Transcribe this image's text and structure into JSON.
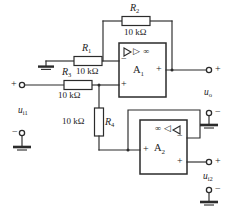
{
  "diagram": {
    "type": "schematic"
  },
  "components": {
    "r1": {
      "ref": "R",
      "sub": "1",
      "value": "10 kΩ"
    },
    "r2": {
      "ref": "R",
      "sub": "2",
      "value": "10 kΩ"
    },
    "r3": {
      "ref": "R",
      "sub": "3",
      "value": "10 kΩ"
    },
    "r4": {
      "ref": "R",
      "sub": "4",
      "value": "10 kΩ"
    }
  },
  "opamps": {
    "a1": {
      "ref": "A",
      "sub": "1",
      "symbol": "▷ ∞",
      "input_minus": "−",
      "input_plus": "+",
      "output_plus": "+"
    },
    "a2": {
      "ref": "A",
      "sub": "2",
      "symbol": "∞ ◁",
      "input_plus": "+",
      "output_minus": "−",
      "output_plus": "+"
    }
  },
  "terminals": {
    "ui1": {
      "label": "u",
      "sub": "i1",
      "plus": "+",
      "minus": "−"
    },
    "ui2": {
      "label": "u",
      "sub": "i2",
      "plus": "+",
      "minus": "−"
    },
    "uo": {
      "label": "u",
      "sub": "o",
      "plus": "+",
      "minus": "−"
    }
  },
  "colors": {
    "line": "#2b2b2b",
    "background": "#ffffff",
    "text": "#1d1d1d"
  }
}
